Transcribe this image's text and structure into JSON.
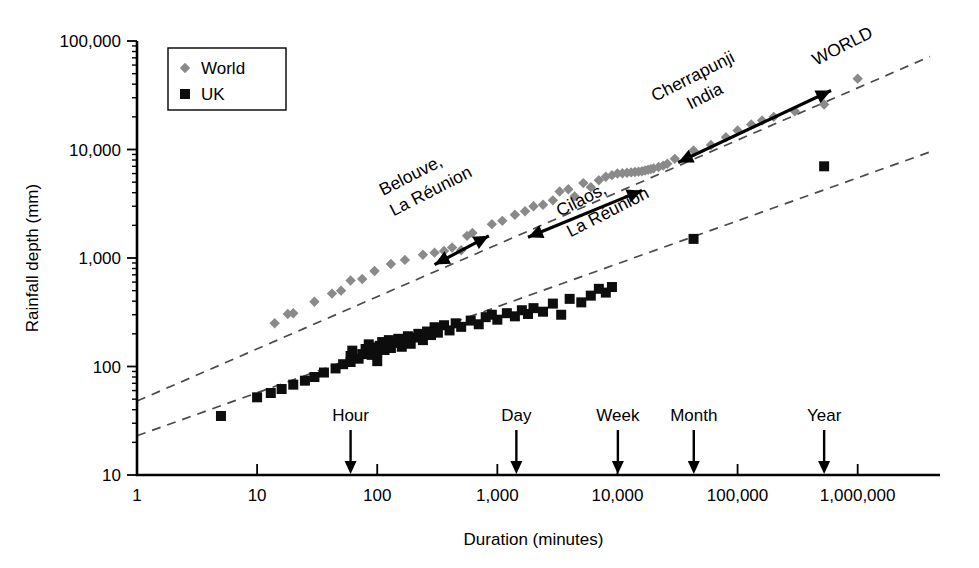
{
  "chart_data": {
    "type": "scatter",
    "title": "",
    "xlabel": "Duration (minutes)",
    "ylabel": "Rainfall depth (mm)",
    "xscale": "log",
    "yscale": "log",
    "xlim": [
      1,
      4000000
    ],
    "ylim": [
      10,
      100000
    ],
    "grid": false,
    "x_tick_labels": [
      "1",
      "10",
      "100",
      "1,000",
      "10,000",
      "100,000",
      "1,000,000"
    ],
    "x_tick_values": [
      1,
      10,
      100,
      1000,
      10000,
      100000,
      1000000
    ],
    "y_tick_labels": [
      "10",
      "100",
      "1,000",
      "10,000",
      "100,000"
    ],
    "y_tick_values": [
      10,
      100,
      1000,
      10000,
      100000
    ],
    "legend_position": "top-left",
    "series": [
      {
        "name": "World",
        "marker": "diamond",
        "color": "#8a8a8a",
        "points": [
          [
            14,
            250
          ],
          [
            18,
            305
          ],
          [
            20,
            310
          ],
          [
            30,
            395
          ],
          [
            42,
            470
          ],
          [
            50,
            500
          ],
          [
            60,
            620
          ],
          [
            75,
            640
          ],
          [
            95,
            760
          ],
          [
            130,
            880
          ],
          [
            170,
            960
          ],
          [
            240,
            1070
          ],
          [
            300,
            1120
          ],
          [
            360,
            1160
          ],
          [
            420,
            1250
          ],
          [
            500,
            1180
          ],
          [
            560,
            1600
          ],
          [
            620,
            1700
          ],
          [
            900,
            2050
          ],
          [
            1100,
            2200
          ],
          [
            1400,
            2500
          ],
          [
            1700,
            2700
          ],
          [
            2000,
            3000
          ],
          [
            2400,
            3100
          ],
          [
            2900,
            3400
          ],
          [
            3300,
            4100
          ],
          [
            3900,
            4300
          ],
          [
            4400,
            3700
          ],
          [
            5200,
            4900
          ],
          [
            6000,
            4500
          ],
          [
            7000,
            5200
          ],
          [
            8000,
            5600
          ],
          [
            9000,
            5800
          ],
          [
            10000,
            6000
          ],
          [
            11000,
            6050
          ],
          [
            12000,
            6100
          ],
          [
            13000,
            6150
          ],
          [
            14000,
            6200
          ],
          [
            15000,
            6250
          ],
          [
            16000,
            6300
          ],
          [
            17000,
            6400
          ],
          [
            18000,
            6500
          ],
          [
            19000,
            6600
          ],
          [
            20000,
            6700
          ],
          [
            22000,
            6900
          ],
          [
            24000,
            7100
          ],
          [
            26000,
            7400
          ],
          [
            30000,
            8200
          ],
          [
            43000,
            9800
          ],
          [
            60000,
            11000
          ],
          [
            80000,
            13000
          ],
          [
            100000,
            15000
          ],
          [
            130000,
            17000
          ],
          [
            160000,
            18500
          ],
          [
            200000,
            20000
          ],
          [
            300000,
            22500
          ],
          [
            525600,
            26000
          ],
          [
            1000000,
            45000
          ]
        ]
      },
      {
        "name": "UK",
        "marker": "square",
        "color": "#0d0d0d",
        "points": [
          [
            5,
            35
          ],
          [
            10,
            52
          ],
          [
            13,
            57
          ],
          [
            16,
            62
          ],
          [
            20,
            68
          ],
          [
            25,
            74
          ],
          [
            30,
            80
          ],
          [
            36,
            88
          ],
          [
            45,
            96
          ],
          [
            52,
            105
          ],
          [
            60,
            110
          ],
          [
            60,
            125
          ],
          [
            62,
            140
          ],
          [
            70,
            118
          ],
          [
            75,
            130
          ],
          [
            80,
            145
          ],
          [
            85,
            160
          ],
          [
            90,
            128
          ],
          [
            95,
            150
          ],
          [
            100,
            112
          ],
          [
            100,
            135
          ],
          [
            105,
            155
          ],
          [
            110,
            168
          ],
          [
            115,
            142
          ],
          [
            120,
            158
          ],
          [
            125,
            175
          ],
          [
            130,
            148
          ],
          [
            140,
            165
          ],
          [
            150,
            180
          ],
          [
            160,
            152
          ],
          [
            170,
            172
          ],
          [
            180,
            190
          ],
          [
            190,
            162
          ],
          [
            200,
            185
          ],
          [
            220,
            200
          ],
          [
            240,
            175
          ],
          [
            260,
            210
          ],
          [
            280,
            195
          ],
          [
            300,
            230
          ],
          [
            320,
            205
          ],
          [
            360,
            240
          ],
          [
            400,
            215
          ],
          [
            450,
            250
          ],
          [
            500,
            232
          ],
          [
            600,
            265
          ],
          [
            700,
            245
          ],
          [
            800,
            285
          ],
          [
            900,
            300
          ],
          [
            1000,
            270
          ],
          [
            1200,
            310
          ],
          [
            1400,
            290
          ],
          [
            1600,
            330
          ],
          [
            1800,
            305
          ],
          [
            2000,
            345
          ],
          [
            2400,
            320
          ],
          [
            2900,
            380
          ],
          [
            3400,
            300
          ],
          [
            4000,
            420
          ],
          [
            5000,
            390
          ],
          [
            6000,
            450
          ],
          [
            7000,
            520
          ],
          [
            8000,
            480
          ],
          [
            9000,
            540
          ],
          [
            43000,
            1500
          ],
          [
            525600,
            7000
          ]
        ]
      }
    ],
    "trend_lines": [
      {
        "name": "WORLD",
        "label": "WORLD",
        "p1": [
          1,
          48
        ],
        "p2": [
          4000000,
          72000
        ]
      },
      {
        "name": "UK",
        "label": "",
        "p1": [
          1,
          23
        ],
        "p2": [
          4000000,
          9500
        ]
      }
    ],
    "annotations": [
      {
        "name": "belouve",
        "text_lines": [
          "Belouve,",
          "La Réunion"
        ],
        "arrow": {
          "from": [
            300,
            870
          ],
          "to": [
            850,
            1600
          ]
        }
      },
      {
        "name": "cilaos",
        "text_lines": [
          "Cilaos,",
          "La Réunion"
        ],
        "arrow": {
          "from": [
            1800,
            1550
          ],
          "to": [
            16000,
            4200
          ]
        }
      },
      {
        "name": "cherrapunji",
        "text_lines": [
          "Cherrapunji",
          "India"
        ],
        "arrow": {
          "from": [
            32000,
            7600
          ],
          "to": [
            600000,
            35000
          ]
        }
      },
      {
        "name": "world-line-label",
        "text_lines": [
          "WORLD"
        ],
        "arrow": null
      }
    ],
    "time_markers": [
      {
        "label": "Hour",
        "x": 60
      },
      {
        "label": "Day",
        "x": 1440
      },
      {
        "label": "Week",
        "x": 10080
      },
      {
        "label": "Month",
        "x": 43200
      },
      {
        "label": "Year",
        "x": 525600
      }
    ]
  },
  "legend": {
    "items": [
      {
        "label": "World",
        "marker": "diamond",
        "color": "#8a8a8a"
      },
      {
        "label": "UK",
        "marker": "square",
        "color": "#0d0d0d"
      }
    ]
  },
  "axes": {
    "x_title": "Duration (minutes)",
    "y_title": "Rainfall depth (mm)"
  }
}
